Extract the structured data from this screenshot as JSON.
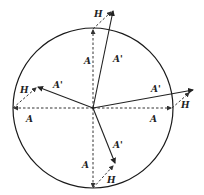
{
  "diagram": {
    "type": "phasor-vector-diagram",
    "circle": {
      "cx": 93,
      "cy": 108,
      "r": 80,
      "color": "#1a1a1a"
    },
    "labels": {
      "original_vector": "A",
      "resultant_vector": "A'",
      "added_vector": "H"
    },
    "vectors": [
      {
        "direction": "up",
        "A": {
          "x": 93,
          "y": 29,
          "label": "A",
          "lx": 84,
          "ly": 64
        },
        "A_prime": {
          "x": 113,
          "y": 10,
          "label": "A'",
          "lx": 113,
          "ly": 62
        },
        "H": {
          "label": "H",
          "lx": 94,
          "ly": 17
        }
      },
      {
        "direction": "left",
        "A": {
          "x": 13,
          "y": 108,
          "label": "A",
          "lx": 26,
          "ly": 122
        },
        "A_prime": {
          "x": 38,
          "y": 87,
          "label": "A'",
          "lx": 53,
          "ly": 88
        },
        "H": {
          "label": "H",
          "lx": 20,
          "ly": 93
        }
      },
      {
        "direction": "right",
        "A": {
          "x": 172,
          "y": 108,
          "label": "A",
          "lx": 150,
          "ly": 122
        },
        "A_prime": {
          "x": 193,
          "y": 90,
          "label": "A'",
          "lx": 151,
          "ly": 92
        },
        "H": {
          "label": "H",
          "lx": 181,
          "ly": 108
        }
      },
      {
        "direction": "down",
        "A": {
          "x": 93,
          "y": 188,
          "label": "A",
          "lx": 82,
          "ly": 168
        },
        "A_prime": {
          "x": 115,
          "y": 163,
          "label": "A'",
          "lx": 113,
          "ly": 148
        },
        "H": {
          "label": "H",
          "lx": 107,
          "ly": 183
        }
      }
    ]
  }
}
